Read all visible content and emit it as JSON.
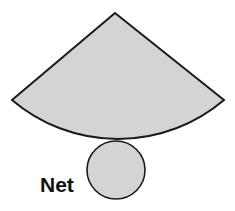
{
  "diagram": {
    "label": "Net",
    "colors": {
      "fill": "#d4d4d4",
      "stroke": "#1a1a1a",
      "background": "#ffffff"
    },
    "shapes": [
      {
        "type": "sector",
        "name": "lateral-surface",
        "apex": [
          115,
          13
        ],
        "left_corner": [
          12,
          100
        ],
        "right_corner": [
          224,
          100
        ],
        "arc_bottom": [
          118,
          139
        ]
      },
      {
        "type": "circle",
        "name": "base",
        "center": [
          116,
          170
        ],
        "radius": 29
      }
    ]
  }
}
